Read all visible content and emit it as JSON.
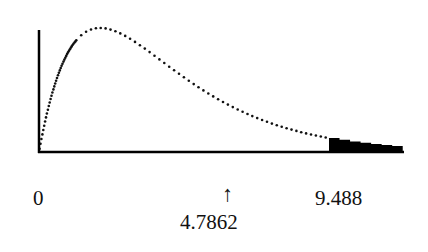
{
  "chart_data": {
    "type": "line",
    "title": "",
    "distribution": "chi-square",
    "degrees_of_freedom": 4,
    "xlabel": "",
    "ylabel": "",
    "xlim": [
      0,
      11.9
    ],
    "ylim": [
      0,
      0.19
    ],
    "grid": false,
    "legend": null,
    "tick_labels": [
      "0",
      "9.488"
    ],
    "critical_value": 9.488,
    "test_statistic": 4.7862,
    "shaded_region": {
      "from": 9.488,
      "to": 11.9,
      "fill": "#000000"
    },
    "annotations": [
      {
        "text": "↑",
        "x": 4.7862,
        "position": "below-axis"
      },
      {
        "text": "4.7862",
        "x": 4.7862,
        "position": "below-arrow"
      }
    ],
    "series": [
      {
        "name": "chi-square pdf (df=4)",
        "style": "dotted",
        "x": [
          0,
          0.5,
          1,
          1.5,
          2,
          2.5,
          3,
          3.5,
          4,
          4.5,
          5,
          5.5,
          6,
          6.5,
          7,
          7.5,
          8,
          8.5,
          9,
          9.488,
          10,
          10.5,
          11,
          11.5,
          11.9
        ],
        "values": [
          0,
          0.0974,
          0.1516,
          0.1771,
          0.1839,
          0.179,
          0.1673,
          0.1522,
          0.1353,
          0.1186,
          0.1026,
          0.0879,
          0.0747,
          0.0629,
          0.0528,
          0.044,
          0.0366,
          0.0303,
          0.025,
          0.0206,
          0.0168,
          0.0138,
          0.0112,
          0.0091,
          0.0077
        ]
      }
    ]
  },
  "labels": {
    "zero": "0",
    "critical": "9.488",
    "arrow": "↑",
    "statistic": "4.7862"
  }
}
